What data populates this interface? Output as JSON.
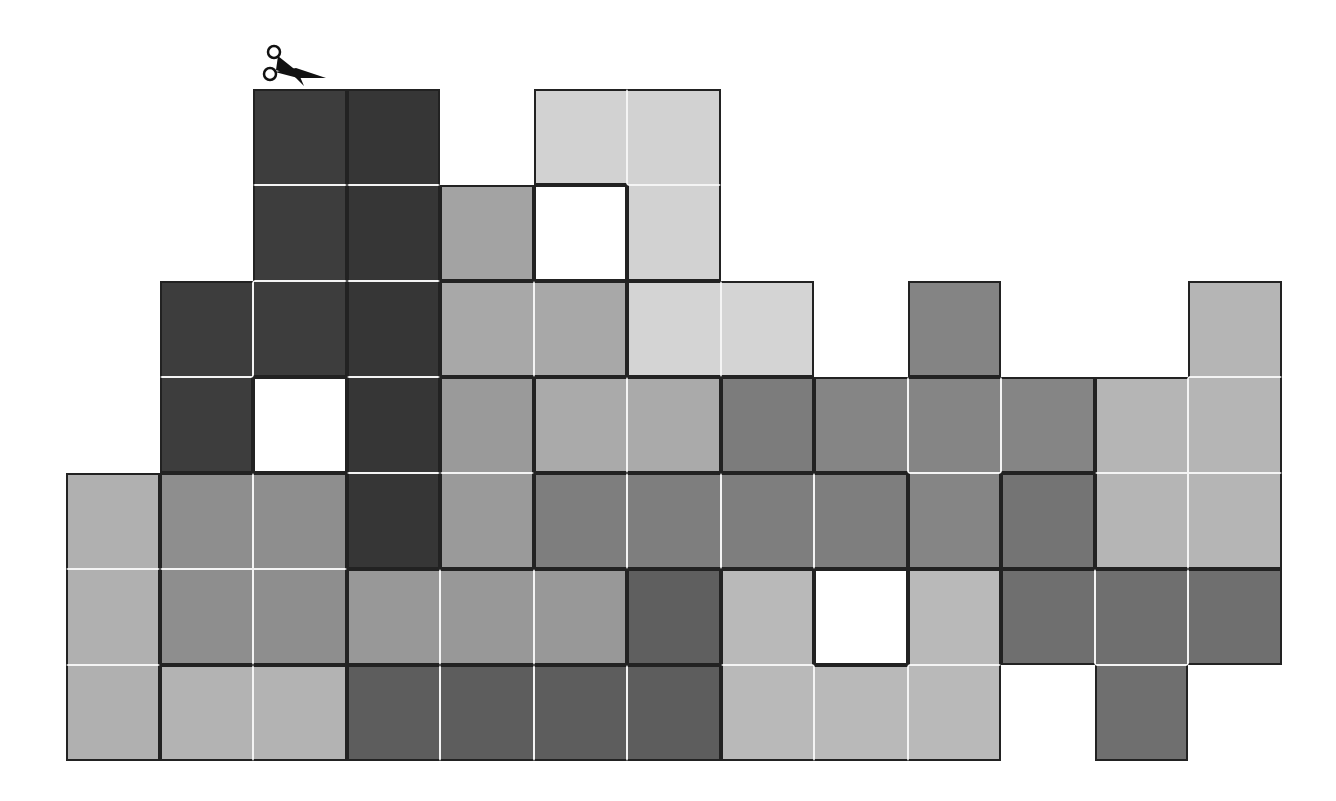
{
  "puzzle": {
    "title": "",
    "grid": {
      "origin_x": 66,
      "origin_y": 89,
      "cell_w": 93.5,
      "cell_h": 96,
      "cols": 13,
      "rows": 7
    },
    "tool_icon": "scissors-icon",
    "colors": {
      "A": "#3d3d3d",
      "B": "#363636",
      "C": "#d2d2d2",
      "D": "#a3a3a3",
      "E": "#a8a8a8",
      "F": "#d4d4d4",
      "G": "#848484",
      "H": "#b5b5b5",
      "I": "#9a9a9a",
      "J": "#aaaaaa",
      "K": "#7c7c7c",
      "L": "#858585",
      "M": "#7e7e7e",
      "N": "#8e8e8e",
      "O": "#b0b0b0",
      "P": "#747474",
      "Q": "#989898",
      "R": "#5f5f5f",
      "S": "#b9b9b9",
      "T": "#6f6f6f",
      "U": "#5d5d5d",
      "V": "#b3b3b3",
      "X": "#ffffff"
    },
    "layout": [
      "..AB.CC......",
      "..ABDXC......",
      ".AABEEFF.G..H",
      ".AXBIJJKLLLHH",
      "ONNBIMMMMLPHH",
      "ONNQQQRSXSTTT",
      "OVVUUUUSSS.T."
    ]
  }
}
